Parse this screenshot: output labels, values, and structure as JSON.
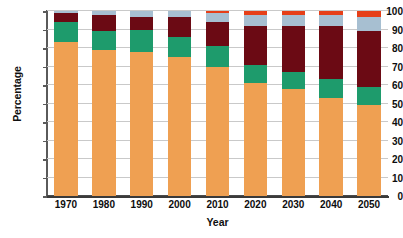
{
  "chart_data": {
    "type": "bar",
    "stacked": true,
    "title": "",
    "xlabel": "Year",
    "ylabel": "Percentage",
    "categories": [
      "1970",
      "1980",
      "1990",
      "2000",
      "2010",
      "2020",
      "2030",
      "2040",
      "2050"
    ],
    "ylim": [
      0,
      100
    ],
    "yticks": [
      0,
      10,
      20,
      30,
      40,
      50,
      60,
      70,
      80,
      90,
      100
    ],
    "ytick_labels": [
      "0",
      "10",
      "20",
      "30",
      "40",
      "50",
      "60",
      "70",
      "80",
      "90",
      "100"
    ],
    "grid": true,
    "legend": "none",
    "series": [
      {
        "name": "series-1",
        "color": "#EFA052",
        "values": [
          83,
          79,
          78,
          75,
          70,
          61,
          58,
          53,
          49
        ]
      },
      {
        "name": "series-2",
        "color": "#1E9B6C",
        "values": [
          11,
          10,
          12,
          11,
          11,
          10,
          9,
          10,
          10
        ]
      },
      {
        "name": "series-3",
        "color": "#6B0A14",
        "values": [
          5,
          9,
          7,
          11,
          13,
          21,
          25,
          29,
          30
        ]
      },
      {
        "name": "series-4",
        "color": "#A7BFD1",
        "values": [
          1,
          2,
          3,
          3,
          5,
          6,
          6,
          6,
          8
        ]
      },
      {
        "name": "series-5",
        "color": "#E63F18",
        "values": [
          0,
          0,
          0,
          0,
          1,
          2,
          2,
          2,
          3
        ]
      }
    ]
  },
  "axes": {
    "y_title": "Percentage",
    "x_title": "Year"
  }
}
